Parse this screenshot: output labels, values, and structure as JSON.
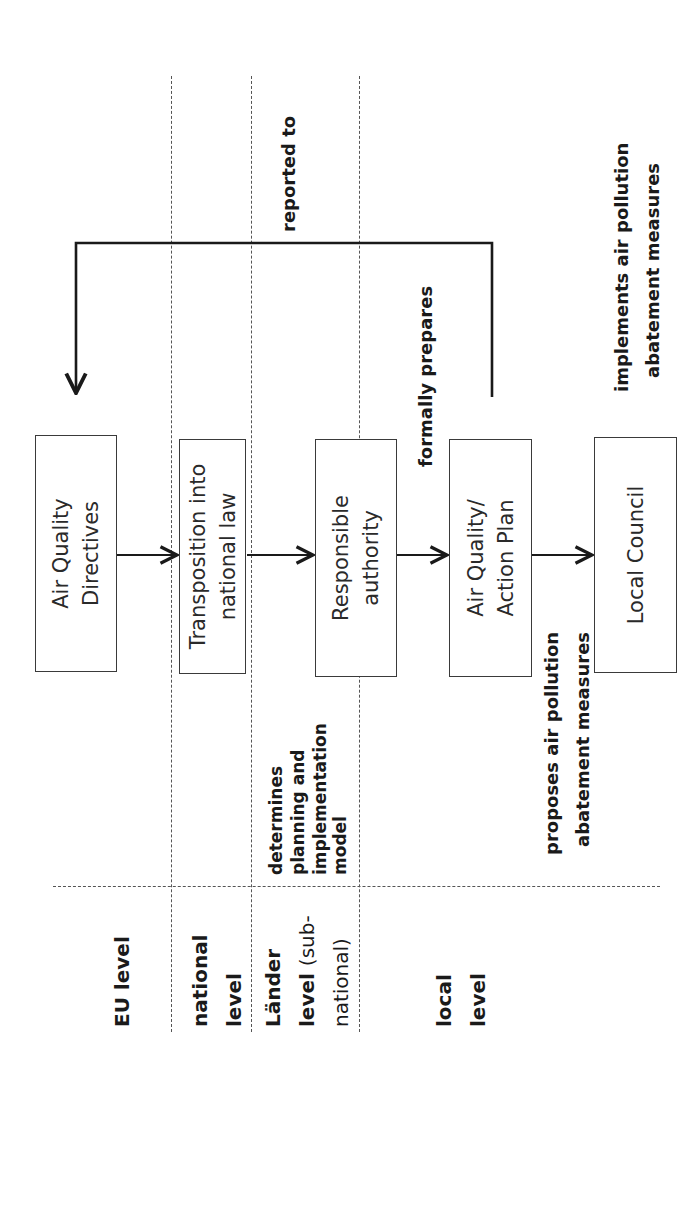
{
  "diagram": {
    "orientation": "rotated-90-ccw",
    "levels": [
      {
        "id": "eu",
        "lines": [
          "EU level"
        ]
      },
      {
        "id": "national",
        "lines": [
          "national",
          "level"
        ]
      },
      {
        "id": "laender",
        "lines": [
          "Länder",
          "level",
          "(sub-",
          "national)"
        ]
      },
      {
        "id": "local",
        "lines": [
          "local",
          "level"
        ]
      }
    ],
    "boxes": [
      {
        "id": "air-quality-directives",
        "lines": [
          "Air Quality",
          "Directives"
        ]
      },
      {
        "id": "transposition",
        "lines": [
          "Transposition into",
          "national law"
        ]
      },
      {
        "id": "responsible-authority",
        "lines": [
          "Responsible",
          "authority"
        ]
      },
      {
        "id": "action-plan",
        "lines": [
          "Air Quality/",
          "Action Plan"
        ]
      },
      {
        "id": "local-council",
        "lines": [
          "Local Council"
        ]
      }
    ],
    "relations": {
      "determines": [
        "determines",
        "planning and",
        "implementation",
        "model"
      ],
      "proposes": [
        "proposes air pollution",
        "abatement measures"
      ],
      "formally_prepares": "formally prepares",
      "reported_to": "reported to",
      "implements": [
        "implements air pollution",
        "abatement measures"
      ]
    },
    "colors": {
      "line": "#1a1a1a",
      "dash": "#555555",
      "box_border": "#3a3a3a"
    }
  }
}
